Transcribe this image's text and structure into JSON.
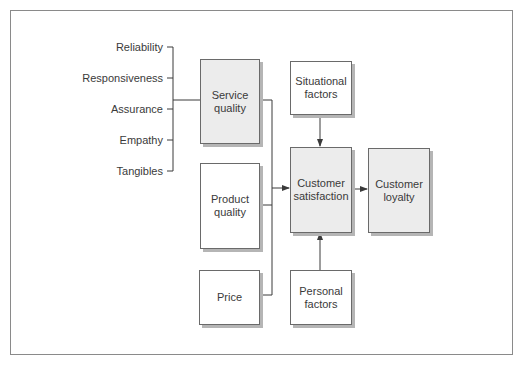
{
  "diagram": {
    "dimensions": [
      "Reliability",
      "Responsiveness",
      "Assurance",
      "Empathy",
      "Tangibles"
    ],
    "boxes": {
      "service_quality": "Service\nquality",
      "product_quality": "Product\nquality",
      "price": "Price",
      "situational_factors": "Situational\nfactors",
      "customer_satisfaction": "Customer\nsatisfaction",
      "customer_loyalty": "Customer\nloyalty",
      "personal_factors": "Personal\nfactors"
    },
    "colors": {
      "shaded_fill": "#ececec",
      "plain_fill": "#ffffff",
      "line": "#3a3a3a",
      "shadow": "#b5b5b5"
    }
  }
}
